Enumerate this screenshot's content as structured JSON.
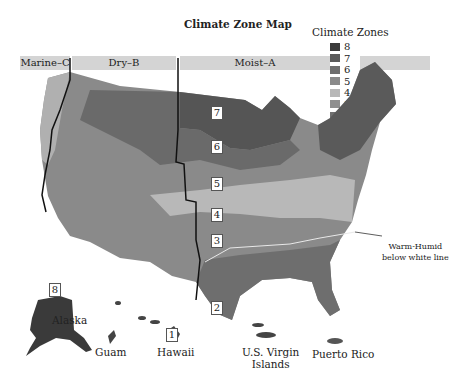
{
  "title": "Climate Zone Map",
  "legend": {
    "title": "Climate Zones",
    "items": [
      {
        "label": "8",
        "color": "#3a3a3a"
      },
      {
        "label": "7",
        "color": "#5a5a5a"
      },
      {
        "label": "6",
        "color": "#6e6e6e"
      },
      {
        "label": "5",
        "color": "#8a8a8a"
      },
      {
        "label": "4",
        "color": "#b8b8b8"
      },
      {
        "label": "3",
        "color": "#8f8f8f"
      },
      {
        "label": "2",
        "color": "#707070"
      },
      {
        "label": "1",
        "color": "#444444"
      }
    ]
  },
  "moisture_regions": [
    {
      "label": "Marine–C"
    },
    {
      "label": "Dry–B"
    },
    {
      "label": "Moist–A"
    }
  ],
  "zone_labels": [
    "8",
    "7",
    "6",
    "5",
    "4",
    "3",
    "2",
    "1"
  ],
  "places": {
    "alaska": "Alaska",
    "guam": "Guam",
    "hawaii": "Hawaii",
    "usvi_line1": "U.S. Virgin",
    "usvi_line2": "Islands",
    "puerto_rico": "Puerto Rico"
  },
  "annotation": {
    "line1": "Warm-Humid",
    "line2": "below white line"
  }
}
